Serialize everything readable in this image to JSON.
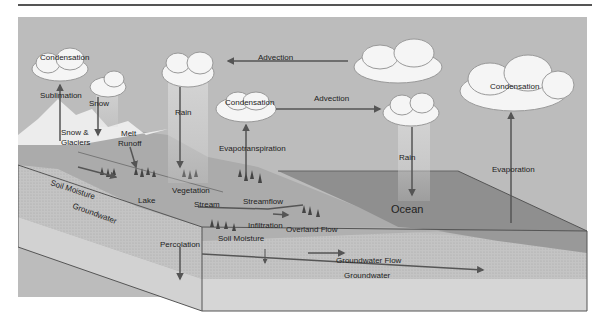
{
  "diagram": {
    "colors": {
      "sky": "#bdbdbd",
      "land": "#a9a9a9",
      "ocean": "#8e8e8e",
      "groundwater": "#c6c6c6",
      "bedrock": "#d6d6d6",
      "arrow": "#555555",
      "cloud": "#f4f4f4"
    },
    "labels": {
      "condensation_1": "Condensation",
      "sublimation": "Sublimation",
      "snow": "Snow",
      "snow_glaciers_1": "Snow &",
      "snow_glaciers_2": "Glaciers",
      "melt_runoff_1": "Melt",
      "melt_runoff_2": "Runoff",
      "rain_1": "Rain",
      "advection_1": "Advection",
      "condensation_2": "Condensation",
      "advection_2": "Advection",
      "evapotranspiration": "Evapotranspiration",
      "rain_2": "Rain",
      "condensation_3": "Condensation",
      "evaporation": "Evaporation",
      "soil_moisture_1": "Soil Moisture",
      "groundwater_1": "Groundwater",
      "lake": "Lake",
      "vegetation": "Vegetation",
      "stream": "Stream",
      "streamflow": "Streamflow",
      "infiltration": "Infiltration",
      "overland_flow": "Overland Flow",
      "percolation": "Percolation",
      "soil_moisture_2": "Soil Moisture",
      "ocean": "Ocean",
      "groundwater_flow": "Groundwater Flow",
      "groundwater_2": "Groundwater"
    }
  }
}
